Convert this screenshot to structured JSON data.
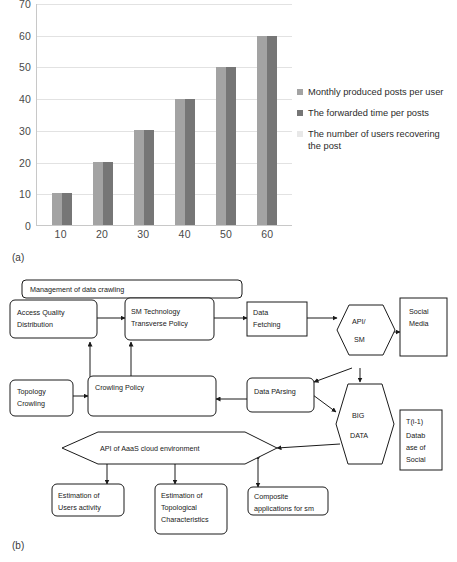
{
  "figure_a": {
    "panel_label": "(a)",
    "chart_data": {
      "type": "bar",
      "title": "",
      "xlabel": "",
      "ylabel": "",
      "ylim": [
        0,
        70
      ],
      "ytick_step": 10,
      "grid": true,
      "legend_position": "right",
      "categories": [
        "10",
        "20",
        "30",
        "40",
        "50",
        "60"
      ],
      "ytick_labels": [
        "70",
        "60",
        "50",
        "40",
        "30",
        "20",
        "10",
        "0"
      ],
      "series": [
        {
          "name": "Monthly produced posts per user",
          "color": "#a3a3a3",
          "values": [
            10,
            20,
            30,
            40,
            50,
            60
          ]
        },
        {
          "name": "The forwarded time per posts",
          "color": "#767676",
          "values": [
            10,
            20,
            30,
            40,
            50,
            60
          ]
        },
        {
          "name": "The number of users recovering the post",
          "color": "#e8e8e8",
          "values": [
            0,
            0,
            0,
            0,
            0,
            0
          ]
        }
      ]
    }
  },
  "figure_b": {
    "panel_label": "(b)",
    "nodes": {
      "management": "Management of data crawling",
      "access_quality": [
        "Access Quality",
        "Distribution"
      ],
      "sm_technology": [
        "SM Technology",
        "Transverse Policy"
      ],
      "data_fetching": [
        "Data",
        "Fetching"
      ],
      "api_sm": [
        "API/",
        "SM"
      ],
      "social_media": [
        "Social",
        "Media"
      ],
      "topology_crowling": [
        "Topology",
        "Crowling"
      ],
      "crowling_policy": "Crowling Policy",
      "data_parsing": "Data PArsing",
      "big_data": [
        "BIG",
        "DATA"
      ],
      "database_social": [
        "T(i-1)",
        "Datab",
        "ase of",
        "Social"
      ],
      "api_aaas": "API of AaaS cloud environment",
      "est_users": [
        "Estimation of",
        "Users activity"
      ],
      "est_topological": [
        "Estimation of",
        "Topological",
        "Characteristics"
      ],
      "composite_apps": [
        "Composite",
        "applications for sm"
      ]
    }
  }
}
